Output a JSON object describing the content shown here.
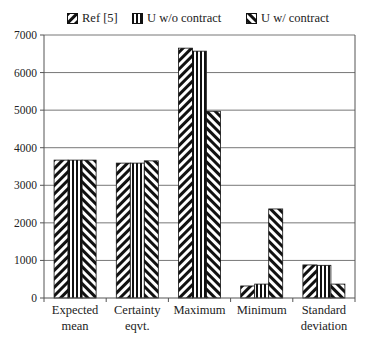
{
  "chart_data": {
    "type": "bar",
    "title": "",
    "xlabel": "",
    "ylabel": "",
    "ylim": [
      0,
      7000
    ],
    "yticks": [
      0,
      1000,
      2000,
      3000,
      4000,
      5000,
      6000,
      7000
    ],
    "grid": true,
    "legend_position": "top",
    "categories": [
      "Expected mean",
      "Certainty eqvt.",
      "Maximum",
      "Minimum",
      "Standard deviation"
    ],
    "category_lines": [
      [
        "Expected",
        "mean"
      ],
      [
        "Certainty",
        "eqvt."
      ],
      [
        "Maximum"
      ],
      [
        "Minimum"
      ],
      [
        "Standard",
        "deviation"
      ]
    ],
    "series": [
      {
        "name": "Ref [5]",
        "pattern": "diag-right",
        "values": [
          3670,
          3590,
          6650,
          320,
          880
        ]
      },
      {
        "name": "U w/o contract",
        "pattern": "vertical",
        "values": [
          3670,
          3590,
          6570,
          370,
          870
        ]
      },
      {
        "name": "U w/ contract",
        "pattern": "diag-left",
        "values": [
          3670,
          3650,
          4970,
          2370,
          370
        ]
      }
    ]
  },
  "legend": {
    "items": [
      {
        "label": "Ref [5]"
      },
      {
        "label": "U w/o contract"
      },
      {
        "label": "U w/ contract"
      }
    ]
  }
}
